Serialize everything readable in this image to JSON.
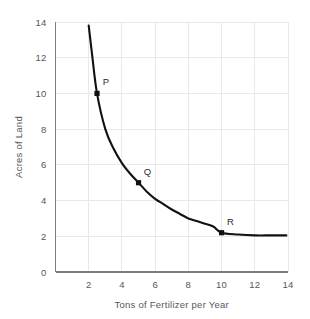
{
  "chart_data": {
    "type": "line",
    "title": "",
    "subtitle": "",
    "xlabel": "Tons of Fertilizer per Year",
    "ylabel": "Acres of Land",
    "xlim": [
      0,
      14
    ],
    "ylim": [
      0,
      14
    ],
    "xticks": [
      2,
      4,
      6,
      8,
      10,
      12,
      14
    ],
    "yticks": [
      0,
      2,
      4,
      6,
      8,
      10,
      12,
      14
    ],
    "xtick_labels": [
      "2",
      "4",
      "6",
      "8",
      "10",
      "12",
      "14"
    ],
    "ytick_labels": [
      "0",
      "2",
      "4",
      "6",
      "8",
      "10",
      "12",
      "14"
    ],
    "grid": true,
    "grid_axis": "both",
    "legend": false,
    "legend_position": "none",
    "series": [
      {
        "name": "Isoquant",
        "x": [
          2.0,
          2.2,
          2.5,
          3.0,
          3.5,
          4.0,
          4.5,
          5.0,
          5.5,
          6.0,
          6.5,
          7.0,
          7.5,
          8.0,
          8.5,
          9.0,
          9.5,
          10.0,
          11.0,
          12.0,
          13.0,
          13.9
        ],
        "y": [
          13.8,
          12.2,
          10.0,
          8.0,
          6.9,
          6.1,
          5.5,
          5.0,
          4.5,
          4.1,
          3.8,
          3.5,
          3.25,
          3.0,
          2.85,
          2.7,
          2.55,
          2.2,
          2.1,
          2.05,
          2.05,
          2.05
        ]
      }
    ],
    "annotations": [
      {
        "label": "P",
        "x": 2.5,
        "y": 10.0,
        "marker": "square",
        "label_dx": 9,
        "label_dy": -8
      },
      {
        "label": "Q",
        "x": 5.0,
        "y": 5.0,
        "marker": "square",
        "label_dx": 9,
        "label_dy": -8
      },
      {
        "label": "R",
        "x": 10.0,
        "y": 2.2,
        "marker": "square",
        "label_dx": 9,
        "label_dy": -8
      }
    ],
    "reference_lines": [
      {
        "orientation": "vertical",
        "value": 2,
        "style": "dotted"
      }
    ],
    "colors": {
      "background": "#ffffff",
      "curve": "#111111",
      "marker": "#111111",
      "gridline": "#e9e9e9",
      "axis": "#7d7d7f",
      "text": "#56565a",
      "annotation_text": "#2b2b2b"
    }
  }
}
